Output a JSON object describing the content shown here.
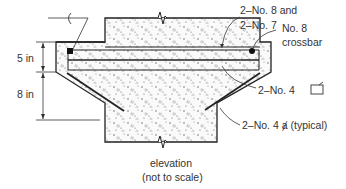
{
  "diagram": {
    "type": "reinforced concrete section",
    "dimensions": [
      {
        "label": "5 in"
      },
      {
        "label": "8 in"
      }
    ],
    "callouts": [
      {
        "id": "top_bars",
        "line1": "2–No. 8 and",
        "line2": "2–No. 7"
      },
      {
        "id": "crossbar",
        "line1": "No. 8",
        "line2": "crossbar"
      },
      {
        "id": "stirrup",
        "text": "2–No. 4",
        "symbol": "closed-stirrup-icon"
      },
      {
        "id": "hook_bars",
        "text": "2–No. 4",
        "symbol": "hook-bar-icon",
        "suffix": "(typical)"
      }
    ],
    "centerline_symbol": "centerline-icon",
    "caption": {
      "line1": "elevation",
      "line2": "(not to scale)"
    },
    "colors": {
      "line": "#222222",
      "text": "#333333",
      "concrete": "#f6f6f6"
    }
  }
}
